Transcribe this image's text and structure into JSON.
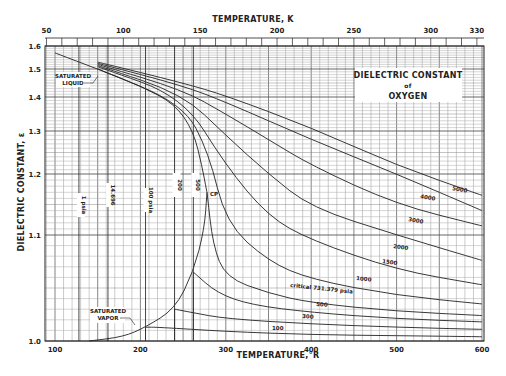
{
  "chart_data": {
    "type": "line",
    "title": "DIELECTRIC CONSTANT of OXYGEN",
    "title_lines": [
      "DIELECTRIC CONSTANT",
      "of",
      "OXYGEN"
    ],
    "xlabel": "TEMPERATURE,°R",
    "x2label": "TEMPERATURE, K",
    "ylabel": "DIELECTRIC CONSTANT, ε",
    "xlim": [
      88,
      600
    ],
    "ylim": [
      1.0,
      1.6
    ],
    "x_ticks": [
      100,
      200,
      300,
      400,
      500,
      600
    ],
    "x2_ticks": [
      50,
      100,
      150,
      200,
      250,
      300,
      330
    ],
    "y_ticks": [
      1.0,
      1.1,
      1.2,
      1.3,
      1.4,
      1.5,
      1.6
    ],
    "grid": true,
    "annotations": {
      "saturated_liquid": "SATURATED LIQUID",
      "saturated_vapor": "SATURATED VAPOR",
      "critical_point": "CP",
      "critical_isobar": "critical  731.379 psia"
    },
    "isobar_labels_vertical": [
      "1 psia",
      "14.696",
      "100 psia",
      "200",
      "500"
    ],
    "series": [
      {
        "name": "1 psia",
        "points": [
          [
            128,
            1.0
          ],
          [
            128,
            1.0005
          ]
        ]
      },
      {
        "name": "14.696",
        "points": [
          [
            162,
            1.0
          ],
          [
            162,
            1.003
          ]
        ]
      },
      {
        "name": "100 psia",
        "points": [
          [
            206,
            1.0
          ],
          [
            206,
            1.013
          ]
        ]
      },
      {
        "name": "200",
        "points": [
          [
            240,
            1.0
          ],
          [
            240,
            1.03
          ]
        ]
      },
      {
        "name": "500",
        "points": [
          [
            262,
            1.0
          ],
          [
            262,
            1.065
          ]
        ]
      },
      {
        "name": "100",
        "points": [
          [
            206,
            1.013
          ],
          [
            220,
            1.013
          ],
          [
            300,
            1.009
          ],
          [
            400,
            1.006
          ],
          [
            500,
            1.005
          ],
          [
            600,
            1.004
          ]
        ]
      },
      {
        "name": "300",
        "points": [
          [
            240,
            1.03
          ],
          [
            260,
            1.027
          ],
          [
            300,
            1.021
          ],
          [
            400,
            1.016
          ],
          [
            500,
            1.013
          ],
          [
            600,
            1.011
          ]
        ]
      },
      {
        "name": "500",
        "points": [
          [
            262,
            1.065
          ],
          [
            290,
            1.045
          ],
          [
            330,
            1.034
          ],
          [
            400,
            1.027
          ],
          [
            500,
            1.021
          ],
          [
            600,
            1.018
          ]
        ]
      },
      {
        "name": "critical 731.379 psia",
        "points": [
          [
            278,
            1.17
          ],
          [
            285,
            1.09
          ],
          [
            300,
            1.06
          ],
          [
            350,
            1.045
          ],
          [
            400,
            1.036
          ],
          [
            500,
            1.028
          ],
          [
            600,
            1.024
          ]
        ]
      },
      {
        "name": "1000",
        "points": [
          [
            150,
            1.5
          ],
          [
            250,
            1.38
          ],
          [
            280,
            1.25
          ],
          [
            300,
            1.12
          ],
          [
            350,
            1.075
          ],
          [
            400,
            1.058
          ],
          [
            500,
            1.043
          ],
          [
            600,
            1.035
          ]
        ]
      },
      {
        "name": "1500",
        "points": [
          [
            150,
            1.51
          ],
          [
            250,
            1.4
          ],
          [
            300,
            1.22
          ],
          [
            350,
            1.13
          ],
          [
            400,
            1.095
          ],
          [
            500,
            1.067
          ],
          [
            600,
            1.053
          ]
        ]
      },
      {
        "name": "2000",
        "points": [
          [
            150,
            1.515
          ],
          [
            250,
            1.41
          ],
          [
            300,
            1.29
          ],
          [
            350,
            1.2
          ],
          [
            400,
            1.145
          ],
          [
            500,
            1.1
          ],
          [
            600,
            1.076
          ]
        ]
      },
      {
        "name": "3000",
        "points": [
          [
            150,
            1.52
          ],
          [
            250,
            1.425
          ],
          [
            300,
            1.35
          ],
          [
            350,
            1.28
          ],
          [
            400,
            1.22
          ],
          [
            500,
            1.15
          ],
          [
            600,
            1.115
          ]
        ]
      },
      {
        "name": "4000",
        "points": [
          [
            150,
            1.525
          ],
          [
            250,
            1.44
          ],
          [
            300,
            1.385
          ],
          [
            400,
            1.28
          ],
          [
            500,
            1.2
          ],
          [
            600,
            1.14
          ]
        ]
      },
      {
        "name": "5000",
        "points": [
          [
            150,
            1.53
          ],
          [
            250,
            1.45
          ],
          [
            300,
            1.405
          ],
          [
            400,
            1.31
          ],
          [
            500,
            1.22
          ],
          [
            600,
            1.165
          ]
        ]
      },
      {
        "name": "Saturated liquid",
        "points": [
          [
            100,
            1.57
          ],
          [
            150,
            1.5
          ],
          [
            200,
            1.44
          ],
          [
            240,
            1.38
          ],
          [
            262,
            1.3
          ],
          [
            272,
            1.22
          ],
          [
            278,
            1.17
          ]
        ]
      },
      {
        "name": "Saturated vapor",
        "points": [
          [
            140,
            1.0
          ],
          [
            180,
            1.004
          ],
          [
            206,
            1.013
          ],
          [
            240,
            1.03
          ],
          [
            262,
            1.065
          ],
          [
            275,
            1.11
          ],
          [
            278,
            1.17
          ]
        ]
      }
    ]
  }
}
